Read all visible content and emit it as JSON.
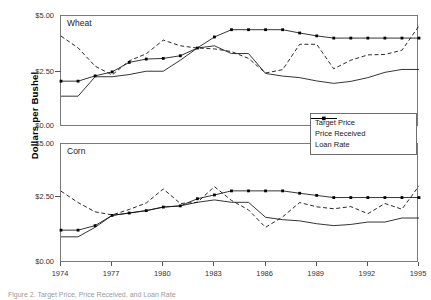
{
  "figure": {
    "ylabel": "Dollars per Bushel",
    "caption": "Figure 2.  Target Price, Price Received, and Loan Rate"
  },
  "legend": {
    "position": "middle-right",
    "items": [
      {
        "label": "Target Price",
        "style": "line-marker"
      },
      {
        "label": "Price Received",
        "style": "dashed"
      },
      {
        "label": "Loan Rate",
        "style": "solid"
      }
    ]
  },
  "axes": {
    "x_ticks": [
      "1974",
      "1977",
      "1980",
      "1983",
      "1986",
      "1989",
      "1992",
      "1995"
    ],
    "y_ticks": [
      "$5.00",
      "$2.50",
      "$0.00"
    ]
  },
  "chart_data": [
    {
      "type": "line",
      "title": "Wheat",
      "xlabel": "",
      "ylabel": "Dollars per Bushel",
      "xlim": [
        1974,
        1995
      ],
      "ylim": [
        0,
        5
      ],
      "ytick_values": [
        0,
        2.5,
        5
      ],
      "grid": false,
      "x": [
        1974,
        1975,
        1976,
        1977,
        1978,
        1979,
        1980,
        1981,
        1982,
        1983,
        1984,
        1985,
        1986,
        1987,
        1988,
        1989,
        1990,
        1991,
        1992,
        1993,
        1994,
        1995
      ],
      "series": [
        {
          "name": "Target Price",
          "style": "line-marker",
          "values": [
            2.05,
            2.05,
            2.29,
            2.47,
            2.9,
            3.05,
            3.08,
            3.2,
            3.55,
            4.05,
            4.38,
            4.38,
            4.38,
            4.38,
            4.23,
            4.1,
            4.0,
            4.0,
            4.0,
            4.0,
            4.0,
            4.0
          ]
        },
        {
          "name": "Price Received",
          "style": "dashed",
          "values": [
            4.09,
            3.56,
            2.73,
            2.33,
            2.97,
            3.29,
            3.91,
            3.65,
            3.55,
            3.51,
            3.39,
            3.08,
            2.42,
            2.57,
            3.72,
            3.72,
            2.61,
            3.0,
            3.24,
            3.26,
            3.45,
            4.55
          ]
        },
        {
          "name": "Loan Rate",
          "style": "solid",
          "values": [
            1.37,
            1.37,
            2.25,
            2.25,
            2.35,
            2.5,
            2.5,
            3.0,
            3.55,
            3.65,
            3.3,
            3.3,
            2.4,
            2.28,
            2.21,
            2.06,
            1.95,
            2.04,
            2.21,
            2.45,
            2.58,
            2.58
          ]
        }
      ]
    },
    {
      "type": "line",
      "title": "Corn",
      "xlabel": "",
      "ylabel": "Dollars per Bushel",
      "xlim": [
        1974,
        1995
      ],
      "ylim": [
        0,
        5
      ],
      "ytick_values": [
        0,
        2.5,
        5
      ],
      "grid": false,
      "x": [
        1974,
        1975,
        1976,
        1977,
        1978,
        1979,
        1980,
        1981,
        1982,
        1983,
        1984,
        1985,
        1986,
        1987,
        1988,
        1989,
        1990,
        1991,
        1992,
        1993,
        1994,
        1995
      ],
      "series": [
        {
          "name": "Target Price",
          "style": "line-marker",
          "values": [
            1.38,
            1.38,
            1.57,
            2.0,
            2.1,
            2.2,
            2.35,
            2.4,
            2.7,
            2.86,
            3.03,
            3.03,
            3.03,
            3.03,
            2.93,
            2.84,
            2.75,
            2.75,
            2.75,
            2.75,
            2.75,
            2.75
          ]
        },
        {
          "name": "Price Received",
          "style": "dashed",
          "values": [
            3.02,
            2.54,
            2.15,
            2.02,
            2.25,
            2.52,
            3.11,
            2.5,
            2.55,
            3.21,
            2.63,
            2.23,
            1.5,
            1.94,
            2.54,
            2.36,
            2.28,
            2.37,
            2.07,
            2.5,
            2.26,
            3.24
          ]
        },
        {
          "name": "Loan Rate",
          "style": "solid",
          "values": [
            1.1,
            1.1,
            1.5,
            2.0,
            2.1,
            2.2,
            2.35,
            2.4,
            2.55,
            2.65,
            2.55,
            2.55,
            1.92,
            1.82,
            1.77,
            1.65,
            1.57,
            1.62,
            1.72,
            1.72,
            1.89,
            1.89
          ]
        }
      ]
    }
  ]
}
